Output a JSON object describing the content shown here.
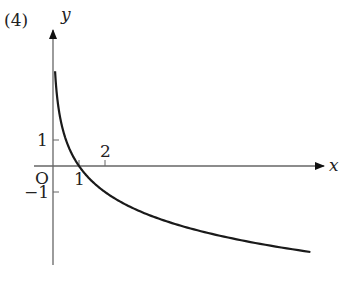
{
  "problem_label": "(4)",
  "chart_data": {
    "type": "line",
    "title": "",
    "xlabel": "x",
    "ylabel": "y",
    "origin_label": "O",
    "x_ticks": [
      {
        "value": 1,
        "label": "1"
      },
      {
        "value": 2,
        "label": "2"
      }
    ],
    "y_ticks": [
      {
        "value": 1,
        "label": "1"
      },
      {
        "value": -1,
        "label": "−1"
      }
    ],
    "series": [
      {
        "name": "y = log_{1/2} x",
        "x": [
          0.08,
          0.125,
          0.25,
          0.5,
          1,
          2,
          4,
          8,
          9.9
        ],
        "values": [
          3.64,
          3,
          2,
          1,
          0,
          -1,
          -2,
          -3,
          -3.31
        ]
      }
    ],
    "xlim": [
      -0.8,
      11
    ],
    "ylim": [
      -4.2,
      4.7
    ],
    "grid": false,
    "legend": "none"
  }
}
